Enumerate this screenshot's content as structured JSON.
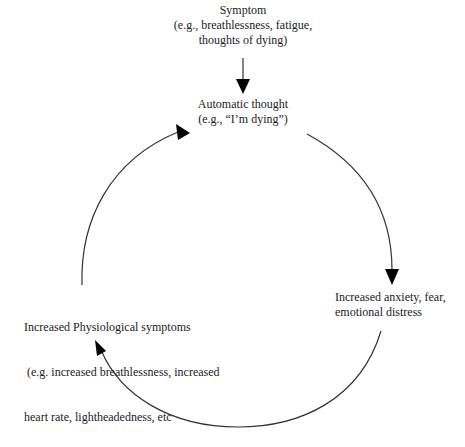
{
  "diagram": {
    "type": "cycle",
    "nodes": {
      "symptom": {
        "line1": "Symptom",
        "line2": "(e.g., breathlessness, fatigue,",
        "line3": "thoughts of dying)"
      },
      "automatic_thought": {
        "line1": "Automatic thought",
        "line2": "(e.g., “I’m dying”)"
      },
      "anxiety": {
        "line1": "Increased anxiety, fear,",
        "line2": "emotional distress"
      },
      "physiological": {
        "line1": "Increased Physiological symptoms",
        "line2": " (e.g. increased breathlessness, increased",
        "line3": "heart rate, lightheadedness, etc"
      }
    },
    "edges": [
      {
        "from": "symptom",
        "to": "automatic_thought",
        "style": "straight-arrow"
      },
      {
        "from": "automatic_thought",
        "to": "anxiety",
        "style": "curved-arrow"
      },
      {
        "from": "anxiety",
        "to": "physiological",
        "style": "curved-arrow"
      },
      {
        "from": "physiological",
        "to": "automatic_thought",
        "style": "curved-arrow"
      }
    ],
    "colors": {
      "line": "#333333",
      "arrowhead": "#000000",
      "text": "#222222"
    }
  }
}
